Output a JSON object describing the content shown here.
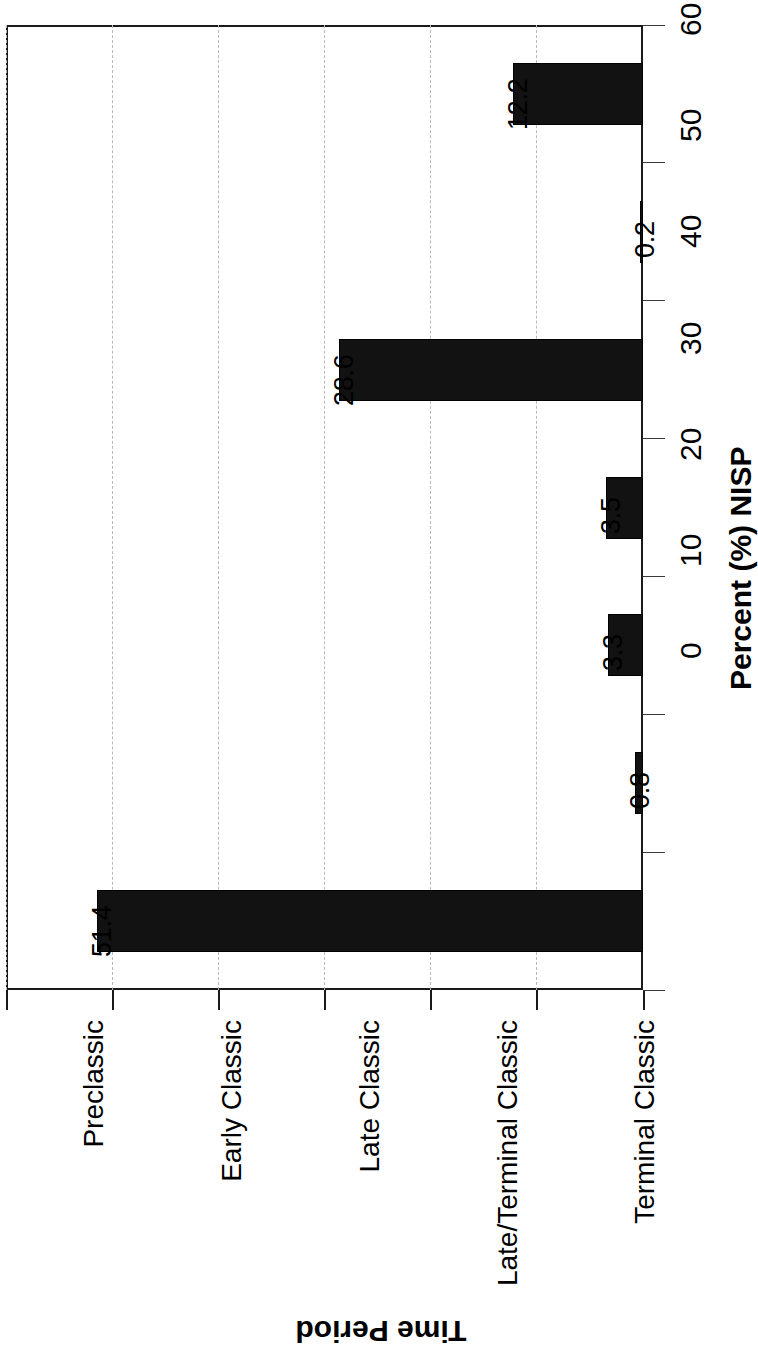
{
  "chart_data": {
    "type": "bar",
    "orientation": "horizontal",
    "rotation_note": "figure printed rotated 90 degrees",
    "title": "",
    "categories": [
      "Preclassic",
      "Early Classic",
      "Late Classic",
      "Late/Terminal Classic",
      "Terminal Classic",
      "Terminal/Postclassic",
      "Postclassic"
    ],
    "values": [
      12.2,
      0.2,
      28.6,
      3.5,
      3.3,
      0.8,
      51.4
    ],
    "value_labels": [
      "12.2",
      "0.2",
      "28.6",
      "3.5",
      "3.3",
      "0.8",
      "51.4"
    ],
    "xlabel": "Time Period",
    "ylabel": "Percent (%) NISP",
    "ylim": [
      0,
      60
    ],
    "yticks": [
      0,
      10,
      20,
      30,
      40,
      50,
      60
    ],
    "ytick_labels": [
      "0",
      "10",
      "20",
      "30",
      "40",
      "50",
      "60"
    ],
    "grid": true,
    "grid_axis": "value",
    "legend": false,
    "bar_color": "#121212",
    "grid_color": "#b9b9b9",
    "frame_color": "#1a1a1a"
  },
  "axes": {
    "value_axis_title": "Percent (%) NISP",
    "category_axis_title": "Time Period"
  }
}
